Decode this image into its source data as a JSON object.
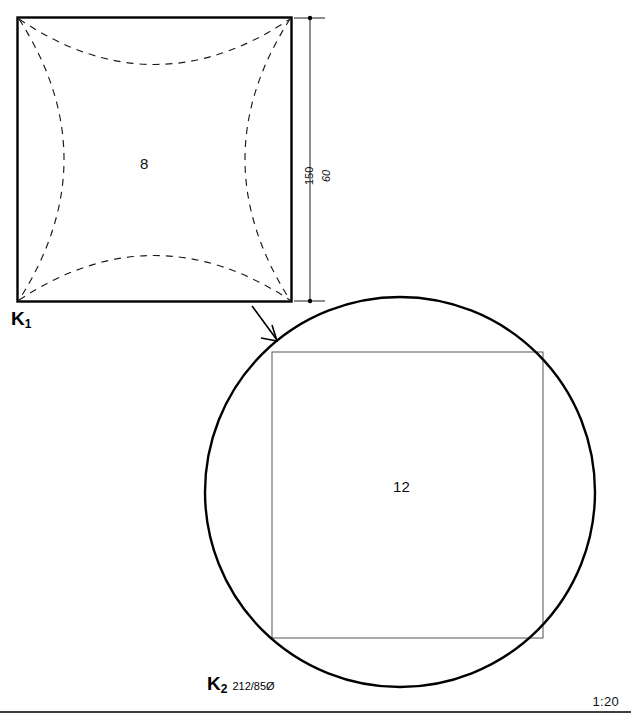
{
  "drawing": {
    "scale_note": "1:20",
    "figures": [
      {
        "id": "k1",
        "caption_letter": "K",
        "caption_subscript": "1",
        "caption_spec": "",
        "center_number": "8",
        "shape": "square",
        "outline": {
          "x": 17,
          "y": 17,
          "width": 275,
          "height": 285
        },
        "stroke_color": "#000000",
        "stroke_width": 2.2,
        "dashed_arcs": true
      },
      {
        "id": "k2",
        "caption_letter": "K",
        "caption_subscript": "2",
        "caption_spec": "212/85Ø",
        "center_number": "12",
        "shape": "circle-with-inscribed-square",
        "circle": {
          "cx": 400,
          "cy": 492,
          "r": 195
        },
        "inner_square": {
          "x": 272,
          "y": 352,
          "width": 271,
          "height": 286
        },
        "stroke_color": "#000000",
        "stroke_width_circle": 2.2,
        "stroke_width_square": 0.9
      }
    ],
    "dimensions": [
      {
        "name": "height-150",
        "value": "150",
        "style": "upright",
        "orientation": "vertical"
      },
      {
        "name": "height-60",
        "value": "60",
        "style": "italic",
        "orientation": "vertical"
      }
    ],
    "annotations": [
      {
        "name": "transform-arrow",
        "from": "square-bottom-right-corner",
        "to": "circle-top-left-edge"
      }
    ],
    "colors": {
      "ink": "#000000",
      "paper": "#ffffff",
      "thin_line": "#444444"
    }
  }
}
